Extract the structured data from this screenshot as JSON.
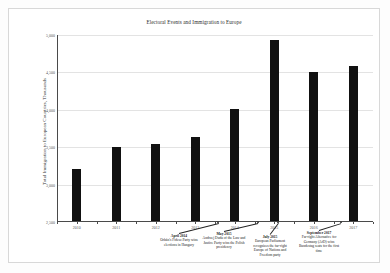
{
  "figure": {
    "title": "Electoral Events and Immigration to Europe",
    "background_color": "#ffffff",
    "frame_color": "#d8d8d8",
    "bar_color": "#111111",
    "grid_color": "#e3e3e3",
    "axis_color": "#4a4a4a"
  },
  "chart_data": {
    "type": "bar",
    "title": "Electoral Events and Immigration to Europe",
    "xlabel": "",
    "ylabel": "Total Immigration to European Countries, Thousands",
    "categories": [
      "2010",
      "2011",
      "2012",
      "2013",
      "2014",
      "2015",
      "2016",
      "2017"
    ],
    "values": [
      3210,
      3500,
      3540,
      3640,
      4010,
      4930,
      4510,
      4580
    ],
    "ylim": [
      2500,
      5000
    ],
    "yticks": [
      2500,
      3000,
      3500,
      4000,
      4500,
      5000
    ],
    "ytick_labels": [
      "2,500",
      "3,000",
      "3,500",
      "4,000",
      "4,500",
      "5,000"
    ],
    "grid": true,
    "grid_axis": "y",
    "legend": false,
    "annotations": [
      {
        "id": "april-2014",
        "title": "April 2014",
        "body": "Orbán's Fidesz Party wins elections in Hungary",
        "points_to_year": "2013.6"
      },
      {
        "id": "may-2015",
        "title": "May 2015",
        "body": "Andrzej Duda of the Law and Justice Party wins the Polish presidency",
        "points_to_year": "2014.6"
      },
      {
        "id": "july-2015",
        "title": "July 2015",
        "body": "European Parliament recognizes the far-right Europe of Nations and Freedom party",
        "points_to_year": "2015.1"
      },
      {
        "id": "september-2017",
        "title": "September 2017",
        "body": "Far-right Alternative for Germany (AfD) wins Bundestag seats for the first time",
        "points_to_year": "2016.7"
      }
    ]
  }
}
